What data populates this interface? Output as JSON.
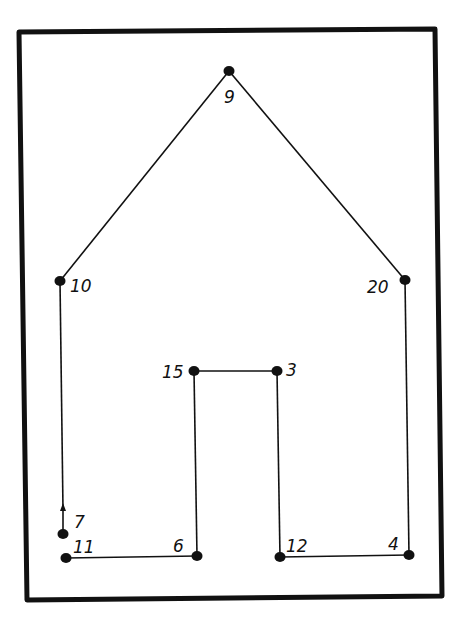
{
  "diagram": {
    "type": "connect-the-dots",
    "colors": {
      "ink": "#111111",
      "background": "#ffffff"
    },
    "frame": {
      "points": [
        [
          19,
          32
        ],
        [
          435,
          29
        ],
        [
          442,
          596
        ],
        [
          27,
          600
        ]
      ],
      "stroke_width": 5
    },
    "dots": [
      {
        "id": "d9",
        "label": "9",
        "x": 229,
        "y": 71,
        "label_x": 224,
        "label_y": 103
      },
      {
        "id": "d10",
        "label": "10",
        "x": 60,
        "y": 281,
        "label_x": 70,
        "label_y": 292
      },
      {
        "id": "d20",
        "label": "20",
        "x": 405,
        "y": 280,
        "label_x": 367,
        "label_y": 293
      },
      {
        "id": "d15",
        "label": "15",
        "x": 194,
        "y": 371,
        "label_x": 162,
        "label_y": 378
      },
      {
        "id": "d3",
        "label": "3",
        "x": 277,
        "y": 371,
        "label_x": 286,
        "label_y": 376
      },
      {
        "id": "d7",
        "label": "7",
        "x": 63,
        "y": 534,
        "label_x": 74,
        "label_y": 528
      },
      {
        "id": "d11",
        "label": "11",
        "x": 66,
        "y": 558,
        "label_x": 73,
        "label_y": 553
      },
      {
        "id": "d6",
        "label": "6",
        "x": 197,
        "y": 556,
        "label_x": 173,
        "label_y": 552
      },
      {
        "id": "d12",
        "label": "12",
        "x": 280,
        "y": 557,
        "label_x": 286,
        "label_y": 552
      },
      {
        "id": "d4",
        "label": "4",
        "x": 409,
        "y": 555,
        "label_x": 388,
        "label_y": 550
      }
    ],
    "lines": [
      {
        "from": "d10",
        "to": "d9"
      },
      {
        "from": "d9",
        "to": "d20"
      },
      {
        "from": "d20",
        "to": "d4"
      },
      {
        "from": "d4",
        "to": "d12"
      },
      {
        "from": "d12",
        "to": "d3"
      },
      {
        "from": "d3",
        "to": "d15"
      },
      {
        "from": "d15",
        "to": "d6"
      },
      {
        "from": "d6",
        "to": "d11"
      }
    ],
    "arrow": {
      "from": [
        60,
        281
      ],
      "to": [
        63,
        510
      ],
      "head_at": [
        63,
        510
      ]
    }
  }
}
